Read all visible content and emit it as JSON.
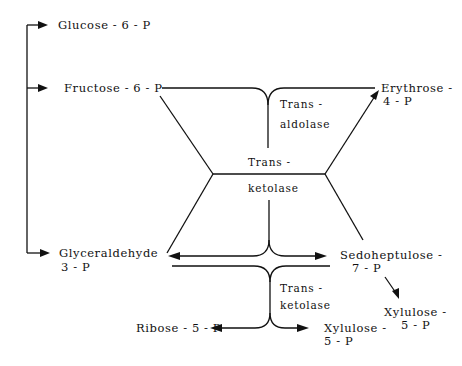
{
  "diagram": {
    "metabolites": {
      "glucose_6p": "Glucose - 6 - P",
      "fructose_6p": "Fructose - 6 - P",
      "erythrose_4p_line1": "Erythrose -",
      "erythrose_4p_line2": "4 - P",
      "glyceraldehyde_3p_line1": "Glyceraldehyde",
      "glyceraldehyde_3p_line2": "3 - P",
      "sedoheptulose_7p_line1": "Sedoheptulose -",
      "sedoheptulose_7p_line2": "7 - P",
      "xylulose_5p_right_line1": "Xylulose -",
      "xylulose_5p_right_line2": "5 - P",
      "ribose_5p": "Ribose - 5 - P",
      "xylulose_5p_bottom_line1": "Xylulose -",
      "xylulose_5p_bottom_line2": "5 - P"
    },
    "enzymes": {
      "transaldolase_line1": "Trans -",
      "transaldolase_line2": "aldolase",
      "transketolase_mid_line1": "Trans -",
      "transketolase_mid_line2": "ketolase",
      "transketolase_low_line1": "Trans -",
      "transketolase_low_line2": "ketolase"
    },
    "colors": {
      "ink": "#111111",
      "background": "#ffffff"
    }
  }
}
